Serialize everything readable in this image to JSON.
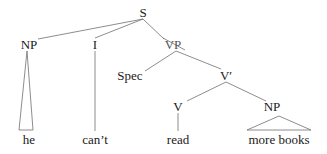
{
  "diagram": {
    "type": "syntax-tree",
    "nodes": {
      "s": {
        "label": "S",
        "x": 143,
        "y": 12
      },
      "np1": {
        "label": "NP",
        "x": 29,
        "y": 44
      },
      "i": {
        "label": "I",
        "x": 95,
        "y": 44
      },
      "vp": {
        "label": "VP",
        "x": 173,
        "y": 44,
        "struck_out": true
      },
      "spec": {
        "label": "Spec",
        "x": 130,
        "y": 75
      },
      "vbar": {
        "label": "V′",
        "x": 226,
        "y": 75
      },
      "v": {
        "label": "V",
        "x": 178,
        "y": 106
      },
      "np2": {
        "label": "NP",
        "x": 272,
        "y": 106
      },
      "he": {
        "label": "he",
        "x": 29,
        "y": 139
      },
      "cant": {
        "label": "can’t",
        "x": 95,
        "y": 139
      },
      "read": {
        "label": "read",
        "x": 178,
        "y": 139
      },
      "morebooks": {
        "label": "more books",
        "x": 272,
        "y": 139
      }
    },
    "edges": [
      [
        "s",
        "np1"
      ],
      [
        "s",
        "i"
      ],
      [
        "s",
        "vp"
      ],
      [
        "vp",
        "spec"
      ],
      [
        "vp",
        "vbar"
      ],
      [
        "vbar",
        "v"
      ],
      [
        "vbar",
        "np2"
      ],
      [
        "i",
        "cant"
      ],
      [
        "v",
        "read"
      ]
    ],
    "triangles": [
      {
        "from": "np1",
        "to": "he"
      },
      {
        "from": "np2",
        "to": "morebooks"
      }
    ],
    "line_color": "#707070"
  }
}
